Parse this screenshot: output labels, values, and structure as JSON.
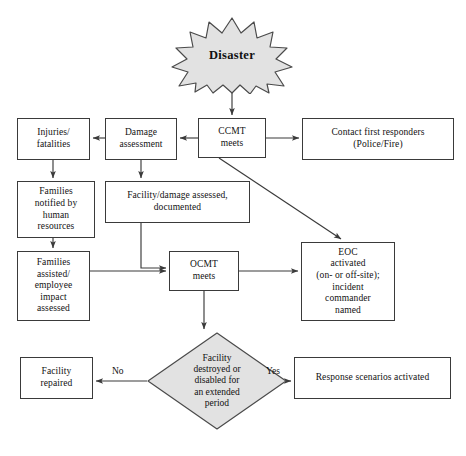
{
  "diagram": {
    "colors": {
      "shape_fill": "#e2e2e2",
      "shape_stroke": "#4a4a4a",
      "box_stroke": "#3a3a3a",
      "box_fill": "#ffffff",
      "line": "#3a3a3a",
      "text": "#111111",
      "background": "#ffffff"
    },
    "start": {
      "label": "Disaster",
      "shape": "starburst"
    },
    "nodes": [
      {
        "id": "ccmt",
        "label": "CCMT\nmeets",
        "shape": "rect",
        "x": 198,
        "y": 118,
        "w": 68,
        "h": 40,
        "font": 9.5
      },
      {
        "id": "responders",
        "label": "Contact first responders\n(Police/Fire)",
        "shape": "rect",
        "x": 302,
        "y": 118,
        "w": 152,
        "h": 42,
        "font": 9.5
      },
      {
        "id": "damage",
        "label": "Damage\nassessment",
        "shape": "rect",
        "x": 105,
        "y": 118,
        "w": 72,
        "h": 42,
        "font": 9.5
      },
      {
        "id": "injuries",
        "label": "Injuries/\nfatalities",
        "shape": "rect",
        "x": 17,
        "y": 118,
        "w": 73,
        "h": 42,
        "font": 9.5
      },
      {
        "id": "families_notified",
        "label": "Families\nnotified by\nhuman\nresources",
        "shape": "rect",
        "x": 17,
        "y": 181,
        "w": 78,
        "h": 57,
        "font": 9.5
      },
      {
        "id": "facility_assessed",
        "label": "Facility/damage assessed,\ndocumented",
        "shape": "rect",
        "x": 105,
        "y": 181,
        "w": 145,
        "h": 42,
        "font": 9.5
      },
      {
        "id": "families_assisted",
        "label": "Families\nassisted/\nemployee\nimpact\nassessed",
        "shape": "rect",
        "x": 17,
        "y": 251,
        "w": 73,
        "h": 70,
        "font": 9.5
      },
      {
        "id": "ocmt",
        "label": "OCMT\nmeets",
        "shape": "rect",
        "x": 169,
        "y": 251,
        "w": 70,
        "h": 40,
        "font": 9.5
      },
      {
        "id": "eoc",
        "label": "EOC\nactivated\n(on- or off-site);\nincident\ncommander\nnamed",
        "shape": "rect",
        "x": 301,
        "y": 242,
        "w": 94,
        "h": 79,
        "font": 9.5
      },
      {
        "id": "decision",
        "label": "Facility\ndestroyed or\ndisabled for\nan extended\nperiod",
        "shape": "diamond",
        "x": 147,
        "y": 332,
        "w": 140,
        "h": 98,
        "font": 9.5
      },
      {
        "id": "facility_repaired",
        "label": "Facility\nrepaired",
        "shape": "rect",
        "x": 20,
        "y": 357,
        "w": 73,
        "h": 42,
        "font": 9.5
      },
      {
        "id": "response_scenarios",
        "label": "Response scenarios activated",
        "shape": "rect",
        "x": 294,
        "y": 357,
        "w": 157,
        "h": 42,
        "font": 9.5
      }
    ],
    "edge_labels": [
      {
        "id": "no",
        "text": "No",
        "x": 112,
        "y": 366
      },
      {
        "id": "yes",
        "text": "Yes",
        "x": 268,
        "y": 366
      }
    ]
  }
}
